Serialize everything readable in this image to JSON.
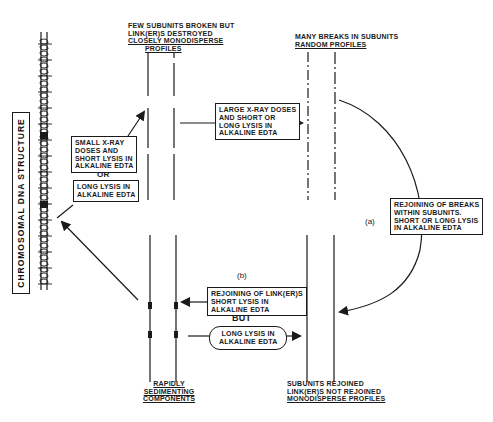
{
  "diagram": {
    "title": "CHROMOSOMAL DNA STRUCTURE",
    "nodes": {
      "top_left_state": {
        "lines": [
          "FEW SUBUNITS BROKEN BUT",
          "LINK(ER)S DESTROYED",
          "CLOSELY MONODISPERSE",
          "PROFILES"
        ]
      },
      "top_right_state": {
        "lines": [
          "MANY BREAKS IN SUBUNITS",
          "RANDOM PROFILES"
        ]
      },
      "bottom_left_state": {
        "lines": [
          "RAPIDLY",
          "SEDIMENTING",
          "COMPONENTS"
        ]
      },
      "bottom_right_state": {
        "lines": [
          "SUBUNITS REJOINED",
          "LINK(ER)S NOT REJOINED",
          "MONODISPERSE PROFILES"
        ]
      }
    },
    "boxes": {
      "small_xray": {
        "lines": [
          "SMALL X-RAY",
          "DOSES AND",
          "SHORT LYSIS IN",
          "ALKALINE EDTA"
        ]
      },
      "or_label": "OR",
      "long_lysis_left": {
        "lines": [
          "LONG LYSIS IN",
          "ALKALINE EDTA"
        ]
      },
      "large_xray": {
        "lines": [
          "LARGE X-RAY DOSES",
          "AND SHORT OR",
          "LONG LYSIS IN",
          "ALKALINE EDTA"
        ]
      },
      "rejoining_within": {
        "lines": [
          "REJOINING OF BREAKS",
          "WITHIN SUBUNITS.",
          "SHORT OR LONG LYSIS",
          "IN ALKALINE EDTA"
        ]
      },
      "rejoining_linkers": {
        "lines": [
          "REJOINING OF LINK(ER)S",
          "SHORT LYSIS IN",
          "ALKALINE EDTA"
        ]
      },
      "but_label": "BUT",
      "long_lysis_bottom": {
        "lines": [
          "LONG LYSIS IN",
          "ALKALINE EDTA"
        ]
      }
    },
    "path_labels": {
      "a": "(a)",
      "b": "(b)"
    }
  }
}
